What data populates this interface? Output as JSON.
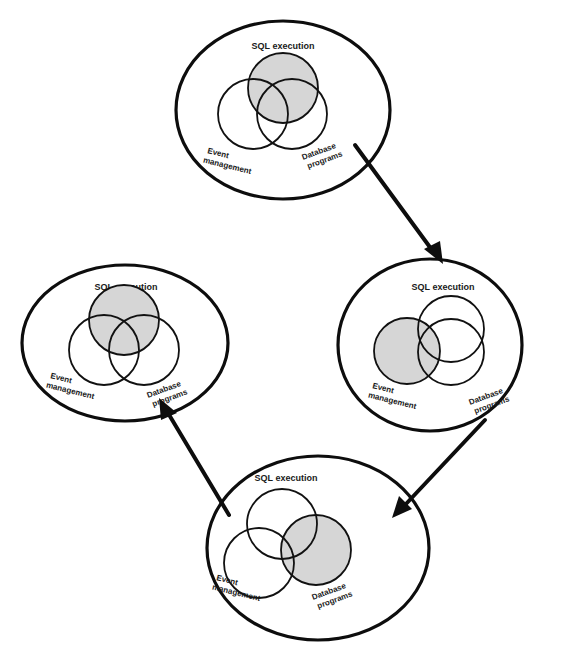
{
  "diagram": {
    "type": "cycle",
    "shade_color": "#d6d6d6",
    "stroke_color": "#0d0d0d",
    "stages": [
      {
        "id": "top",
        "title": "SQL execution",
        "left_label_1": "Event",
        "left_label_2": "management",
        "right_label_1": "Database",
        "right_label_2": "programs",
        "highlighted": "SQL execution"
      },
      {
        "id": "right",
        "title": "SQL execution",
        "left_label_1": "Event",
        "left_label_2": "management",
        "right_label_1": "Database",
        "right_label_2": "programs",
        "highlighted": "Event management"
      },
      {
        "id": "bottom",
        "title": "SQL execution",
        "left_label_1": "Event",
        "left_label_2": "management",
        "right_label_1": "Database",
        "right_label_2": "programs",
        "highlighted": "Database programs"
      },
      {
        "id": "left",
        "title": "SQL execution",
        "left_label_1": "Event",
        "left_label_2": "management",
        "right_label_1": "Database",
        "right_label_2": "programs",
        "highlighted": "SQL execution"
      }
    ],
    "arrows": [
      {
        "from": "top",
        "to": "right"
      },
      {
        "from": "right",
        "to": "bottom"
      },
      {
        "from": "bottom",
        "to": "left"
      }
    ]
  }
}
